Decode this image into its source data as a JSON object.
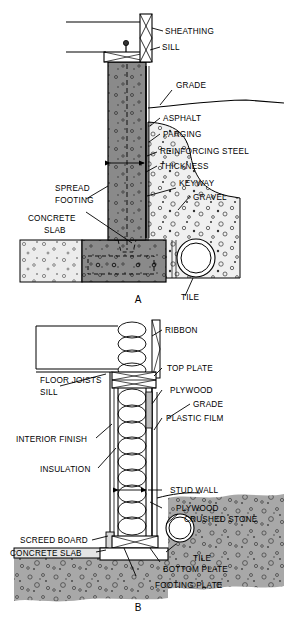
{
  "figure": {
    "panel_a_label": "A",
    "panel_b_label": "B"
  },
  "colors": {
    "wall_concrete": "#8a8a8a",
    "soil_fill": "#a8a8a8",
    "gravel_fill": "#efefef",
    "slab_fill": "#e8e8e8",
    "line": "#000000",
    "background": "#ffffff"
  },
  "panel_a": {
    "name": "poured-concrete-foundation-detail",
    "labels": [
      {
        "id": "sheathing",
        "text": "SHEATHING"
      },
      {
        "id": "sill",
        "text": "SILL"
      },
      {
        "id": "grade",
        "text": "GRADE"
      },
      {
        "id": "asphalt",
        "text": "ASPHALT"
      },
      {
        "id": "parging",
        "text": "PARGING"
      },
      {
        "id": "reinforcing-steel",
        "text": "REINFORCING STEEL"
      },
      {
        "id": "thickness",
        "text": "THICKNESS"
      },
      {
        "id": "keyway",
        "text": "KEYWAY"
      },
      {
        "id": "gravel",
        "text": "GRAVEL"
      },
      {
        "id": "spread-footing-1",
        "text": "SPREAD"
      },
      {
        "id": "spread-footing-2",
        "text": "FOOTING"
      },
      {
        "id": "concrete-slab-1",
        "text": "CONCRETE"
      },
      {
        "id": "concrete-slab-2",
        "text": "SLAB"
      },
      {
        "id": "tile",
        "text": "TILE"
      }
    ]
  },
  "panel_b": {
    "name": "wood-foundation-wall-detail",
    "labels": [
      {
        "id": "floor-joists",
        "text": "FLOOR JOISTS"
      },
      {
        "id": "ribbon",
        "text": "RIBBON"
      },
      {
        "id": "top-plate",
        "text": "TOP PLATE"
      },
      {
        "id": "sill",
        "text": "SILL"
      },
      {
        "id": "plywood-upper",
        "text": "PLYWOOD"
      },
      {
        "id": "grade",
        "text": "GRADE"
      },
      {
        "id": "interior-finish",
        "text": "INTERIOR FINISH"
      },
      {
        "id": "plastic-film",
        "text": "PLASTIC FILM"
      },
      {
        "id": "insulation",
        "text": "INSULATION"
      },
      {
        "id": "stud-wall",
        "text": "STUD WALL"
      },
      {
        "id": "plywood-lower",
        "text": "PLYWOOD"
      },
      {
        "id": "crushed-stone",
        "text": "CRUSHED STONE"
      },
      {
        "id": "screed-board",
        "text": "SCREED BOARD"
      },
      {
        "id": "concrete-slab",
        "text": "CONCRETE SLAB"
      },
      {
        "id": "tile",
        "text": "TILE"
      },
      {
        "id": "bottom-plate",
        "text": "BOTTOM PLATE"
      },
      {
        "id": "footing-plate",
        "text": "FOOTING PLATE"
      }
    ]
  }
}
